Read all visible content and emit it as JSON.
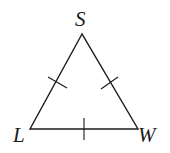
{
  "diagram": {
    "type": "isosceles/equilateral triangle",
    "vertices": {
      "top": {
        "label": "S"
      },
      "left": {
        "label": "L"
      },
      "right": {
        "label": "W"
      }
    },
    "tick_marks": {
      "SL": 1,
      "SW": 1,
      "LW": 1
    },
    "stroke_color": "#1a1a1a"
  }
}
